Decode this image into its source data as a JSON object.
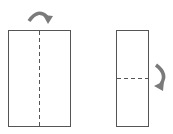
{
  "diagram": {
    "colors": {
      "outline": "#555555",
      "arrow": "#7a7a7a",
      "background": "#ffffff"
    },
    "steps": [
      {
        "label": "Fold in half vertically",
        "fold_line": "vertical",
        "arrow": "curved-arrow-right-over"
      },
      {
        "label": "Fold in half horizontally",
        "fold_line": "horizontal",
        "arrow": "curved-arrow-down"
      }
    ]
  }
}
